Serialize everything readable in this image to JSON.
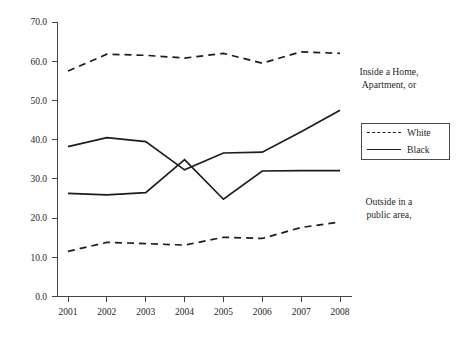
{
  "chart_data": {
    "type": "line",
    "title": "",
    "xlabel": "",
    "ylabel": "",
    "categories": [
      "2001",
      "2002",
      "2003",
      "2004",
      "2005",
      "2006",
      "2007",
      "2008"
    ],
    "x": [
      2001,
      2002,
      2003,
      2004,
      2005,
      2006,
      2007,
      2008
    ],
    "xlim": [
      2001,
      2008
    ],
    "ylim": [
      0.0,
      70.0
    ],
    "yticks": [
      "0.0",
      "10.0",
      "20.0",
      "30.0",
      "40.0",
      "50.0",
      "60.0",
      "70.0"
    ],
    "ytick_values": [
      0.0,
      10.0,
      20.0,
      30.0,
      40.0,
      50.0,
      60.0,
      70.0
    ],
    "grid": false,
    "legend_position": "right",
    "series": [
      {
        "name": "White",
        "group": "Inside a Home, Apartment, or",
        "style": "dashed",
        "color": "#1c1c1c",
        "values": [
          57.5,
          61.8,
          61.5,
          60.8,
          62.0,
          59.5,
          62.4,
          62.0
        ]
      },
      {
        "name": "Black",
        "group": "Inside a Home, Apartment, or",
        "style": "solid",
        "color": "#1c1c1c",
        "values": [
          38.2,
          40.5,
          39.5,
          32.3,
          36.6,
          36.8,
          42.0,
          47.5
        ]
      },
      {
        "name": "White",
        "group": "Outside in a public area,",
        "style": "dashed",
        "color": "#1c1c1c",
        "values": [
          11.5,
          13.8,
          13.5,
          13.1,
          15.1,
          14.8,
          17.6,
          19.0
        ]
      },
      {
        "name": "Black",
        "group": "Outside in a public area,",
        "style": "solid",
        "color": "#1c1c1c",
        "values": [
          26.3,
          25.9,
          26.5,
          34.9,
          24.8,
          32.0,
          32.1,
          32.1
        ]
      }
    ],
    "annotations": [
      {
        "id": "inside-home",
        "text": "Inside a Home,\nApartment, or"
      },
      {
        "id": "outside-public",
        "text": "Outside in a\npublic area,"
      }
    ],
    "legend": [
      {
        "label": "White",
        "style": "dashed"
      },
      {
        "label": "Black",
        "style": "solid"
      }
    ]
  },
  "annotations": {
    "inside_home": "Inside a Home,\nApartment, or",
    "outside_public": "Outside in a\npublic area,"
  },
  "legend": {
    "white_label": "White",
    "black_label": "Black"
  }
}
